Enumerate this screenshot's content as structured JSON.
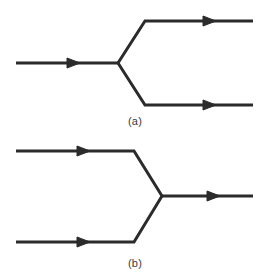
{
  "figure": {
    "background_color": "#ffffff",
    "stroke_color": "#2b2b2b",
    "text_color": "#3a3a3a",
    "stroke_width": 3,
    "width": 270,
    "height": 279
  },
  "panels": [
    {
      "id": "a",
      "caption": "(a)",
      "description": "one incoming arrow splitting into two outgoing arrows",
      "vertex": {
        "x": 118,
        "y": 63
      },
      "edges": [
        {
          "name": "incoming-line",
          "direction": "incoming",
          "points": "16,63 118,63",
          "arrow_at": {
            "x": 80,
            "y": 63
          },
          "arrow_angle": 0
        },
        {
          "name": "outgoing-upper-line",
          "direction": "outgoing",
          "points": "118,63 145,21 253,21",
          "arrow_at": {
            "x": 216,
            "y": 21
          },
          "arrow_angle": 0
        },
        {
          "name": "outgoing-lower-line",
          "direction": "outgoing",
          "points": "118,63 145,105 253,105",
          "arrow_at": {
            "x": 216,
            "y": 105
          },
          "arrow_angle": 0
        }
      ]
    },
    {
      "id": "b",
      "caption": "(b)",
      "description": "two incoming arrows merging into one outgoing arrow",
      "vertex": {
        "x": 162,
        "y": 57
      },
      "edges": [
        {
          "name": "incoming-upper-line",
          "direction": "incoming",
          "points": "16,12 134,12 162,57",
          "arrow_at": {
            "x": 90,
            "y": 12
          },
          "arrow_angle": 0
        },
        {
          "name": "incoming-lower-line",
          "direction": "incoming",
          "points": "16,103 134,103 162,57",
          "arrow_at": {
            "x": 90,
            "y": 103
          },
          "arrow_angle": 0
        },
        {
          "name": "outgoing-line",
          "direction": "outgoing",
          "points": "162,57 253,57",
          "arrow_at": {
            "x": 220,
            "y": 57
          },
          "arrow_angle": 0
        }
      ]
    }
  ]
}
